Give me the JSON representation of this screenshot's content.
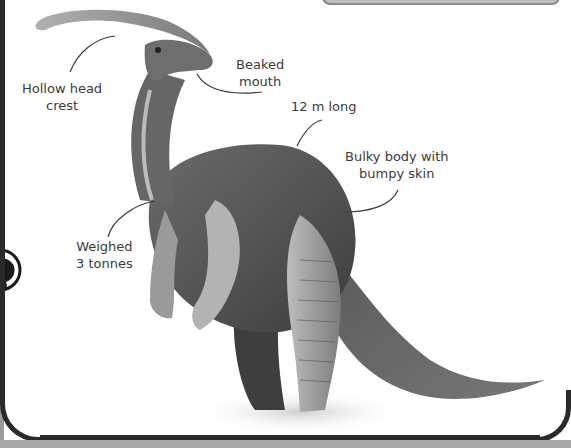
{
  "figure": {
    "labels": [
      {
        "id": "crest",
        "text_line1": "Hollow head",
        "text_line2": "crest"
      },
      {
        "id": "mouth",
        "text_line1": "Beaked",
        "text_line2": "mouth"
      },
      {
        "id": "length",
        "text_line1": "12 m long",
        "text_line2": ""
      },
      {
        "id": "body",
        "text_line1": "Bulky body with",
        "text_line2": "bumpy skin"
      },
      {
        "id": "weight",
        "text_line1": "Weighed",
        "text_line2": "3 tonnes"
      }
    ]
  },
  "colors": {
    "frame": "#2a2a2a",
    "bottom_strip": "#a9a9a9",
    "top_box": "#bdbdbd",
    "label_text": "#3a3a3a",
    "dino_dark": "#4a4a4a",
    "dino_mid": "#8a8a8a",
    "dino_light": "#c8c8c8"
  }
}
